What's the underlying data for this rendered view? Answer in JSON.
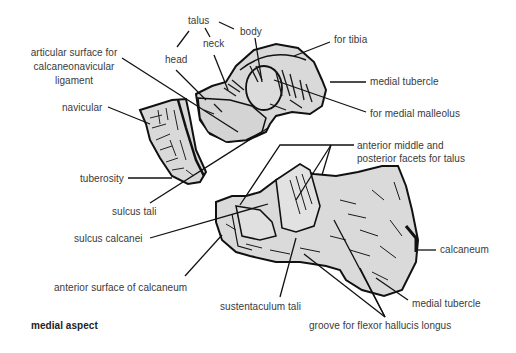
{
  "figure": {
    "caption": "medial aspect",
    "colors": {
      "bone_fill": "#d9d9d9",
      "ink": "#111111",
      "text": "#3a3a3a",
      "background": "#ffffff"
    }
  },
  "labels": {
    "talus": "talus",
    "body": "body",
    "neck": "neck",
    "head": "head",
    "for_tibia": "for tibia",
    "articular_surface_line1": "articular surface for",
    "articular_surface_line2": "calcaneonavicular",
    "articular_surface_line3": "ligament",
    "medial_tubercle_talus": "medial tubercle",
    "for_medial_malleolus": "for medial malleolus",
    "navicular": "navicular",
    "tuberosity": "tuberosity",
    "facets_line1": "anterior middle and",
    "facets_line2": "posterior facets for talus",
    "sulcus_tali": "sulcus tali",
    "sulcus_calcanei": "sulcus calcanei",
    "calcaneum": "calcaneum",
    "anterior_surface": "anterior surface of calcaneum",
    "sustentaculum_tali": "sustentaculum tali",
    "medial_tubercle_calcaneum": "medial tubercle",
    "groove_fhl": "groove for flexor hallucis longus"
  }
}
